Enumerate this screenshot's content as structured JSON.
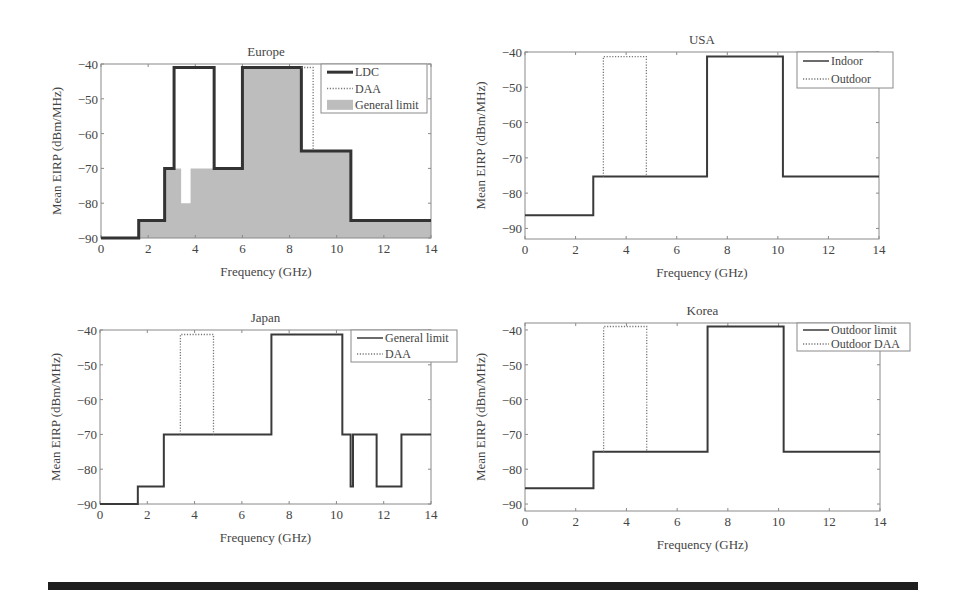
{
  "chart_data": [
    {
      "type": "line",
      "title": "Europe",
      "xlabel": "Frequency (GHz)",
      "ylabel": "Mean EIRP (dBm/MHz)",
      "xlim": [
        0,
        14
      ],
      "ylim": [
        -90,
        -40
      ],
      "xticks": [
        0,
        2,
        4,
        6,
        8,
        10,
        12,
        14
      ],
      "yticks": [
        -40,
        -50,
        -60,
        -70,
        -80,
        -90
      ],
      "grid": false,
      "legend_position": "upper right",
      "frame": {
        "left": 101,
        "top": 64,
        "right": 431,
        "bottom": 238
      },
      "legend_box": {
        "x": 321,
        "y": 64,
        "w": 106,
        "h": 49
      },
      "series": [
        {
          "name": "LDC",
          "style": "thick-solid",
          "x": [
            0,
            1.6,
            1.6,
            2.7,
            2.7,
            3.1,
            3.1,
            4.8,
            4.8,
            6.0,
            6.0,
            8.5,
            8.5,
            10.6,
            10.6,
            14
          ],
          "y": [
            -90,
            -90,
            -85,
            -85,
            -70,
            -70,
            -41,
            -41,
            -70,
            -70,
            -41,
            -41,
            -65,
            -65,
            -85,
            -85
          ]
        },
        {
          "name": "DAA",
          "style": "dotted",
          "x": [
            8.5,
            9.0,
            9.0
          ],
          "y": [
            -41,
            -41,
            -65
          ]
        },
        {
          "name": "General limit",
          "style": "fill",
          "x": [
            0,
            1.6,
            1.6,
            2.7,
            2.7,
            3.4,
            3.4,
            3.8,
            3.8,
            6.0,
            6.0,
            8.5,
            8.5,
            10.6,
            10.6,
            14
          ],
          "y": [
            -90,
            -90,
            -85,
            -85,
            -70,
            -70,
            -80,
            -80,
            -70,
            -70,
            -41,
            -41,
            -65,
            -65,
            -85,
            -85
          ]
        }
      ]
    },
    {
      "type": "line",
      "title": "USA",
      "xlabel": "Frequency (GHz)",
      "ylabel": "Mean EIRP (dBm/MHz)",
      "xlim": [
        0,
        14
      ],
      "ylim": [
        -93,
        -40
      ],
      "xticks": [
        0,
        2,
        4,
        6,
        8,
        10,
        12,
        14
      ],
      "yticks": [
        -40,
        -50,
        -60,
        -70,
        -80,
        -90
      ],
      "grid": false,
      "legend_position": "upper right (outside)",
      "frame": {
        "left": 525,
        "top": 52,
        "right": 879,
        "bottom": 239
      },
      "legend_box": {
        "x": 797,
        "y": 52,
        "w": 96,
        "h": 36
      },
      "series": [
        {
          "name": "Indoor",
          "style": "solid",
          "x": [
            0,
            2.7,
            2.7,
            7.2,
            7.2,
            10.2,
            10.2,
            14
          ],
          "y": [
            -86.3,
            -86.3,
            -75.3,
            -75.3,
            -41.3,
            -41.3,
            -75.3,
            -75.3
          ]
        },
        {
          "name": "Outdoor",
          "style": "dotted",
          "x": [
            3.1,
            3.1,
            4.8,
            4.8
          ],
          "y": [
            -75.3,
            -41.3,
            -41.3,
            -75.3
          ]
        }
      ]
    },
    {
      "type": "line",
      "title": "Japan",
      "xlabel": "Frequency (GHz)",
      "ylabel": "Mean EIRP (dBm/MHz)",
      "xlim": [
        0,
        14
      ],
      "ylim": [
        -90,
        -40
      ],
      "xticks": [
        0,
        2,
        4,
        6,
        8,
        10,
        12,
        14
      ],
      "yticks": [
        -40,
        -50,
        -60,
        -70,
        -80,
        -90
      ],
      "grid": false,
      "legend_position": "upper right",
      "frame": {
        "left": 100,
        "top": 330,
        "right": 431,
        "bottom": 504
      },
      "legend_box": {
        "x": 351,
        "y": 330,
        "w": 106,
        "h": 32
      },
      "series": [
        {
          "name": "General limit",
          "style": "solid",
          "x": [
            0,
            1.6,
            1.6,
            2.7,
            2.7,
            7.25,
            7.25,
            10.25,
            10.25,
            10.6,
            10.6,
            10.7,
            10.7,
            11.7,
            11.7,
            12.75,
            12.75,
            14
          ],
          "y": [
            -90,
            -90,
            -85,
            -85,
            -70,
            -70,
            -41.3,
            -41.3,
            -70,
            -70,
            -85,
            -85,
            -70,
            -70,
            -85,
            -85,
            -70,
            -70
          ]
        },
        {
          "name": "DAA",
          "style": "dotted",
          "x": [
            3.4,
            3.4,
            4.8,
            4.8
          ],
          "y": [
            -70,
            -41.3,
            -41.3,
            -70
          ]
        }
      ]
    },
    {
      "type": "line",
      "title": "Korea",
      "xlabel": "Frequency (GHz)",
      "ylabel": "Mean EIRP (dBm/MHz)",
      "xlim": [
        0,
        14
      ],
      "ylim": [
        -92,
        -38
      ],
      "xticks": [
        0,
        2,
        4,
        6,
        8,
        10,
        12,
        14
      ],
      "yticks": [
        -40,
        -50,
        -60,
        -70,
        -80,
        -90
      ],
      "grid": false,
      "legend_position": "upper right (outside)",
      "frame": {
        "left": 525,
        "top": 323,
        "right": 880,
        "bottom": 511
      },
      "legend_box": {
        "x": 797,
        "y": 323,
        "w": 113,
        "h": 28
      },
      "series": [
        {
          "name": "Outdoor limit",
          "style": "solid",
          "x": [
            0,
            2.7,
            2.7,
            7.2,
            7.2,
            10.2,
            10.2,
            14
          ],
          "y": [
            -85.5,
            -85.5,
            -75,
            -75,
            -39,
            -39,
            -75,
            -75
          ]
        },
        {
          "name": "Outdoor DAA",
          "style": "dotted",
          "x": [
            3.1,
            3.1,
            4.8,
            4.8
          ],
          "y": [
            -75,
            -39,
            -39,
            -75
          ]
        }
      ]
    }
  ],
  "colors": {
    "line": "#3a3a3a",
    "thick_line": "#333333",
    "fill": "#bdbdbd",
    "axis": "#8a8a8a",
    "text": "#444444",
    "bottom_bar": "#1e1e1e"
  }
}
